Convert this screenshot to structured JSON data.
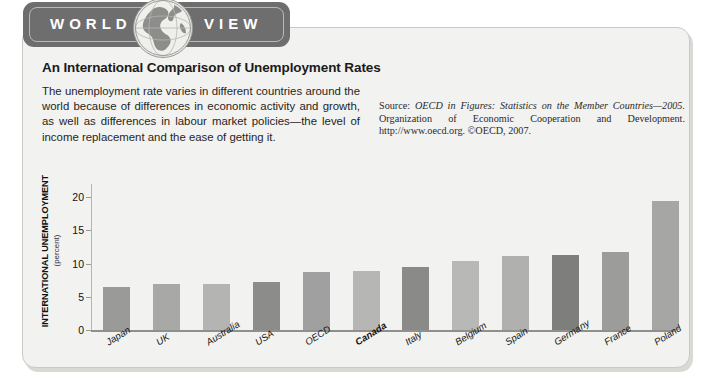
{
  "badge": {
    "word_left": "WORLD",
    "word_right": "VIEW",
    "globe_icon": "globe-icon"
  },
  "article": {
    "headline": "An International Comparison of Unemployment Rates",
    "intro": "The unemployment rate varies in different countries around the world because of differences in economic activity and growth, as well as differences in labour market policies—the level of income replacement and the ease of getting it.",
    "source_prefix": "Source: ",
    "source_italic": "OECD in Figures: Statistics on the Member Countries—2005.",
    "source_rest": " Organization of Economic Cooperation and Development. http://www.oecd.org. ©OECD, 2007."
  },
  "chart_data": {
    "type": "bar",
    "title": "An International Comparison of Unemployment Rates",
    "xlabel": "",
    "ylabel": "INTERNATIONAL UNEMPLOYMENT",
    "ylabel_sub": "(percent)",
    "ylim": [
      0,
      22
    ],
    "yticks": [
      0,
      5,
      10,
      15,
      20
    ],
    "grid": false,
    "legend": "none",
    "highlight_category": "Canada",
    "categories": [
      "Japan",
      "UK",
      "Australia",
      "USA",
      "OECD",
      "Canada",
      "Italy",
      "Belgium",
      "Spain",
      "Germany",
      "France",
      "Poland"
    ],
    "values": [
      6.5,
      7.0,
      7.0,
      7.2,
      8.7,
      8.9,
      9.5,
      10.4,
      11.1,
      11.3,
      11.7,
      19.5
    ],
    "bar_colors": [
      "#9a9a98",
      "#a8a8a6",
      "#b4b4b2",
      "#8c8c8a",
      "#a0a0a0",
      "#b6b6b4",
      "#8a8a88",
      "#b8b8b6",
      "#b0b0ae",
      "#7e7e7c",
      "#9c9c9a",
      "#a6a6a4"
    ]
  },
  "colors": {
    "panel_bg": "#f2f2f0",
    "panel_border": "#c9c9c6",
    "badge_bg": "#6e6e6e",
    "axis": "#8f8f8c",
    "text": "#1a1a1a"
  }
}
